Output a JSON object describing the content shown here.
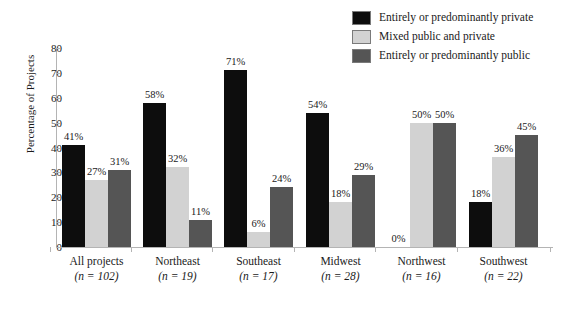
{
  "chart_data": {
    "type": "bar",
    "title": "",
    "xlabel": "",
    "ylabel": "Percentage of Projects",
    "ylim": [
      0,
      80
    ],
    "yticks": [
      0,
      10,
      20,
      30,
      40,
      50,
      60,
      70,
      80
    ],
    "grid": false,
    "legend_position": "top-right",
    "value_suffix": "%",
    "categories": [
      "All projects",
      "Northeast",
      "Southeast",
      "Midwest",
      "Northwest",
      "Southwest"
    ],
    "category_n": [
      "(n = 102)",
      "(n = 19)",
      "(n = 17)",
      "(n = 28)",
      "(n = 16)",
      "(n = 22)"
    ],
    "series": [
      {
        "name": "Entirely or predominantly private",
        "color": "#0d0d0d",
        "values": [
          41,
          58,
          71,
          54,
          0,
          18
        ],
        "labels": [
          "41%",
          "58%",
          "71%",
          "54%",
          "0%",
          "18%"
        ]
      },
      {
        "name": "Mixed public and private",
        "color": "#d2d2d2",
        "values": [
          27,
          32,
          6,
          18,
          50,
          36
        ],
        "labels": [
          "27%",
          "32%",
          "6%",
          "18%",
          "50%",
          "36%"
        ]
      },
      {
        "name": "Entirely or predominantly public",
        "color": "#555555",
        "values": [
          31,
          11,
          24,
          29,
          50,
          45
        ],
        "labels": [
          "31%",
          "11%",
          "24%",
          "29%",
          "50%",
          "45%"
        ]
      }
    ]
  },
  "legend": {
    "items": [
      {
        "label": "Entirely or predominantly private",
        "color": "#0d0d0d"
      },
      {
        "label": "Mixed public and private",
        "color": "#d2d2d2"
      },
      {
        "label": "Entirely or predominantly public",
        "color": "#555555"
      }
    ]
  },
  "axes": {
    "y_title": "Percentage of Projects",
    "y_ticks": [
      "80",
      "70",
      "60",
      "50",
      "40",
      "30",
      "20",
      "10",
      "0"
    ]
  }
}
